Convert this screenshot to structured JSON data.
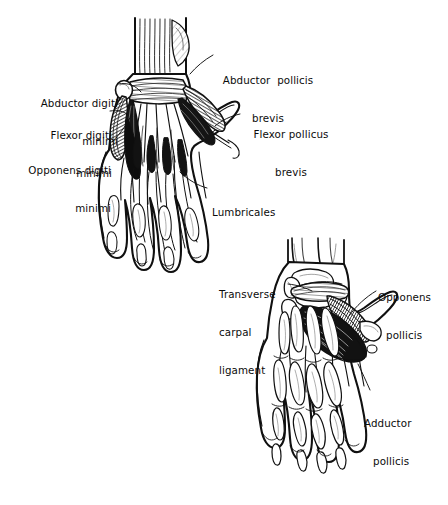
{
  "figure": {
    "kind": "anatomical-illustration",
    "background_color": "#ffffff",
    "ink_color": "#101010",
    "panels": [
      {
        "id": "upper-hand",
        "name": "superficial-palmar-dissection",
        "description": "Left hand, palmar view, superficial layer: thenar and hypothenar muscles with lumbricals and flexor tendons"
      },
      {
        "id": "lower-hand",
        "name": "deep-palmar-dissection",
        "description": "Left hand, palmar view, deep layer: carpal bones, transverse carpal ligament, opponens pollicis and adductor pollicis"
      }
    ]
  },
  "labels": {
    "abductor_digiti_minimi": {
      "lines": [
        "Abductor digiti",
        "minimi"
      ],
      "align": "right"
    },
    "flexor_digiti_minimi": {
      "lines": [
        "Flexor digiti",
        "minimi"
      ],
      "align": "right"
    },
    "opponens_digiti_minimi": {
      "lines": [
        "Opponens digiti",
        "minimi"
      ],
      "align": "right"
    },
    "abductor_pollicis_brevis": {
      "lines": [
        "Abductor  pollicis",
        "brevis"
      ],
      "align": "left"
    },
    "flexor_pollicus_brevis": {
      "lines": [
        "Flexor pollicus",
        "brevis"
      ],
      "align": "left"
    },
    "lumbricales": {
      "lines": [
        "Lumbricales"
      ],
      "align": "left"
    },
    "transverse_carpal_ligament": {
      "lines": [
        "Transverse",
        "carpal",
        "ligament"
      ],
      "align": "left"
    },
    "opponens_pollicis": {
      "lines": [
        "Opponens",
        "pollicis"
      ],
      "align": "left"
    },
    "adductor_pollicis": {
      "lines": [
        "Adductor",
        "pollicis"
      ],
      "align": "left"
    }
  }
}
